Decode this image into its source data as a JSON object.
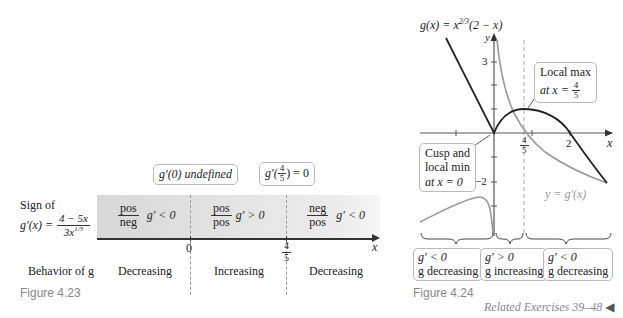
{
  "left_figure": {
    "caption": "Figure 4.23",
    "row_label_sign_line1": "Sign of",
    "row_label_sign_expr_lhs": "g′(x) =",
    "row_label_sign_numerator": "4 − 5x",
    "row_label_sign_denominator": "3x",
    "row_label_sign_denominator_exp": "1/3",
    "row_label_behavior": "Behavior of g",
    "callouts": [
      {
        "text": "g′(0) undefined"
      },
      {
        "text_prefix": "g′(",
        "frac_num": "4",
        "frac_den": "5",
        "text_suffix": ") = 0"
      }
    ],
    "intervals": [
      {
        "num": "pos",
        "den": "neg",
        "sign": "g′ < 0",
        "behavior": "Decreasing"
      },
      {
        "num": "pos",
        "den": "pos",
        "sign": "g′ > 0",
        "behavior": "Increasing"
      },
      {
        "num": "neg",
        "den": "pos",
        "sign": "g′ < 0",
        "behavior": "Decreasing"
      }
    ],
    "axis_ticks": [
      {
        "label": "0"
      },
      {
        "num": "4",
        "den": "5"
      }
    ],
    "axis_label": "x"
  },
  "right_figure": {
    "caption": "Figure 4.24",
    "function_label": "g(x) = x^{2/3}(2 − x)",
    "function_label_base": "g(x) = x",
    "function_label_exp": "2/3",
    "function_label_rest": "(2 − x)",
    "derivative_label": "y = g′(x)",
    "x_axis_label": "x",
    "y_axis_label": "y",
    "x_ticks": [
      {
        "label": "4/5",
        "num": "4",
        "den": "5"
      },
      {
        "label": "2"
      }
    ],
    "y_ticks": [
      {
        "label": "3"
      },
      {
        "label": "−2"
      }
    ],
    "callouts": {
      "local_max_line1": "Local max",
      "local_max_line2_prefix": "at x =",
      "local_max_num": "4",
      "local_max_den": "5",
      "cusp_line1": "Cusp and",
      "cusp_line2": "local min",
      "cusp_line3": "at x = 0"
    },
    "interval_boxes": [
      {
        "line1": "g′ < 0",
        "line2": "g decreasing"
      },
      {
        "line1": "g′ > 0",
        "line2": "g increasing"
      },
      {
        "line1": "g′ < 0",
        "line2": "g decreasing"
      }
    ]
  },
  "footer": {
    "related_exercises": "Related Exercises 39–48",
    "end_marker": "◀"
  }
}
